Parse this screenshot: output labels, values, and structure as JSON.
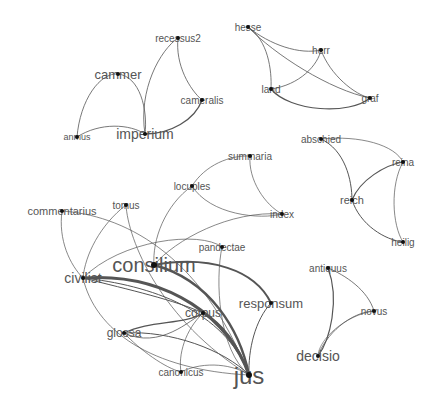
{
  "diagram": {
    "type": "network-graph",
    "node_color": "#111111",
    "edge_color": "#555555",
    "label_color": "#555555",
    "nodes": [
      {
        "id": "cammer",
        "label": "cammer",
        "x": 118,
        "y": 74,
        "size": 13
      },
      {
        "id": "recessus2",
        "label": "recessus2",
        "x": 178,
        "y": 38,
        "size": 10
      },
      {
        "id": "cameralis",
        "label": "cameralis",
        "x": 202,
        "y": 100,
        "size": 10
      },
      {
        "id": "anmus",
        "label": "anmus",
        "x": 77,
        "y": 137,
        "size": 9
      },
      {
        "id": "imperium",
        "label": "imperium",
        "x": 145,
        "y": 134,
        "size": 14
      },
      {
        "id": "hesse",
        "label": "hesse",
        "x": 248,
        "y": 27,
        "size": 10
      },
      {
        "id": "herr",
        "label": "herr",
        "x": 321,
        "y": 50,
        "size": 10
      },
      {
        "id": "land",
        "label": "land",
        "x": 271,
        "y": 89,
        "size": 10
      },
      {
        "id": "graf",
        "label": "graf",
        "x": 370,
        "y": 98,
        "size": 10
      },
      {
        "id": "abschied",
        "label": "abschied",
        "x": 321,
        "y": 139,
        "size": 10
      },
      {
        "id": "reina",
        "label": "reina",
        "x": 403,
        "y": 162,
        "size": 10
      },
      {
        "id": "reich",
        "label": "reich",
        "x": 352,
        "y": 200,
        "size": 11
      },
      {
        "id": "heilig",
        "label": "heilig",
        "x": 403,
        "y": 242,
        "size": 10
      },
      {
        "id": "summaria",
        "label": "summaria",
        "x": 250,
        "y": 156,
        "size": 10
      },
      {
        "id": "locuples",
        "label": "locuples",
        "x": 192,
        "y": 186,
        "size": 10
      },
      {
        "id": "tomus",
        "label": "tomus",
        "x": 126,
        "y": 205,
        "size": 10
      },
      {
        "id": "commentarius",
        "label": "commentarius",
        "x": 62,
        "y": 211,
        "size": 11
      },
      {
        "id": "index",
        "label": "index",
        "x": 282,
        "y": 214,
        "size": 10
      },
      {
        "id": "pandectae",
        "label": "pandectae",
        "x": 222,
        "y": 247,
        "size": 10
      },
      {
        "id": "consilium",
        "label": "consilium",
        "x": 154,
        "y": 265,
        "size": 20
      },
      {
        "id": "civilist",
        "label": "civilist",
        "x": 83,
        "y": 278,
        "size": 14
      },
      {
        "id": "responsum",
        "label": "responsum",
        "x": 271,
        "y": 303,
        "size": 13
      },
      {
        "id": "corpus",
        "label": "corpus",
        "x": 203,
        "y": 313,
        "size": 12
      },
      {
        "id": "glossa",
        "label": "glossa",
        "x": 124,
        "y": 333,
        "size": 12
      },
      {
        "id": "canonicus",
        "label": "canonicus",
        "x": 181,
        "y": 372,
        "size": 10
      },
      {
        "id": "jus",
        "label": "jus",
        "x": 249,
        "y": 375,
        "size": 24
      },
      {
        "id": "antiquus",
        "label": "antiquus",
        "x": 328,
        "y": 268,
        "size": 10
      },
      {
        "id": "novus",
        "label": "novus",
        "x": 374,
        "y": 311,
        "size": 10
      },
      {
        "id": "decisio",
        "label": "decisio",
        "x": 318,
        "y": 356,
        "size": 14
      }
    ],
    "edges": [
      {
        "d": "M77,137 C80,100 100,72 118,74",
        "w": 0.8
      },
      {
        "d": "M118,74 C140,76 148,110 145,134",
        "w": 0.8
      },
      {
        "d": "M77,137 C100,122 130,124 145,134",
        "w": 0.8
      },
      {
        "d": "M145,134 C138,90 160,50 178,38",
        "w": 0.8
      },
      {
        "d": "M178,38 C175,65 190,90 202,100",
        "w": 0.8
      },
      {
        "d": "M145,134 C170,134 195,120 202,100",
        "w": 1.3
      },
      {
        "d": "M248,27 C270,45 300,55 321,50",
        "w": 0.8
      },
      {
        "d": "M248,27 C275,55 330,90 370,98",
        "w": 0.8
      },
      {
        "d": "M248,27 C268,40 272,70 271,89",
        "w": 0.8
      },
      {
        "d": "M271,89 C300,85 318,65 321,50",
        "w": 0.8
      },
      {
        "d": "M321,50 C330,75 355,95 370,98",
        "w": 0.8
      },
      {
        "d": "M271,89 C290,112 350,115 370,98",
        "w": 1.2
      },
      {
        "d": "M321,139 C345,150 352,180 352,200",
        "w": 1.0
      },
      {
        "d": "M321,139 C360,135 395,145 403,162",
        "w": 0.7
      },
      {
        "d": "M352,200 C360,180 385,165 403,162",
        "w": 1.2
      },
      {
        "d": "M352,200 C360,225 385,240 403,242",
        "w": 1.0
      },
      {
        "d": "M403,162 C390,185 392,225 403,242",
        "w": 0.7
      },
      {
        "d": "M192,186 C205,165 230,155 250,156",
        "w": 0.7
      },
      {
        "d": "M250,156 C248,180 265,205 282,214",
        "w": 0.7
      },
      {
        "d": "M192,186 C210,215 260,220 282,214",
        "w": 0.7
      },
      {
        "d": "M192,186 C165,205 152,240 154,265",
        "w": 0.7
      },
      {
        "d": "M282,214 C230,210 175,240 154,265",
        "w": 0.7
      },
      {
        "d": "M62,211 C120,215 200,250 249,375",
        "w": 0.7
      },
      {
        "d": "M62,211 C58,240 70,265 83,278",
        "w": 0.7
      },
      {
        "d": "M126,205 C100,225 85,255 83,278",
        "w": 0.7
      },
      {
        "d": "M126,205 C128,240 160,320 249,375",
        "w": 0.7
      },
      {
        "d": "M83,278 C120,240 200,230 222,247",
        "w": 0.7
      },
      {
        "d": "M222,247 C215,280 218,350 249,375",
        "w": 0.7
      },
      {
        "d": "M154,265 C210,255 255,270 271,303",
        "w": 2.0
      },
      {
        "d": "M271,303 C255,320 248,350 249,375",
        "w": 1.0
      },
      {
        "d": "M83,278 C170,272 230,320 249,375",
        "w": 3.0
      },
      {
        "d": "M154,265 C210,280 240,330 249,375",
        "w": 2.4
      },
      {
        "d": "M83,278 C150,285 225,310 249,375",
        "w": 1.0
      },
      {
        "d": "M203,313 C225,325 240,350 249,375",
        "w": 2.0
      },
      {
        "d": "M83,278 C130,290 175,300 203,313",
        "w": 1.0
      },
      {
        "d": "M124,333 C150,320 185,325 203,313",
        "w": 1.2
      },
      {
        "d": "M124,333 C160,350 190,320 203,313",
        "w": 0.8
      },
      {
        "d": "M124,333 C170,330 225,350 249,375",
        "w": 1.0
      },
      {
        "d": "M83,278 C95,330 150,370 249,375",
        "w": 0.7
      },
      {
        "d": "M203,313 C185,330 178,355 181,372",
        "w": 0.7
      },
      {
        "d": "M181,372 C205,360 235,365 249,375",
        "w": 0.7
      },
      {
        "d": "M124,333 C140,350 165,368 181,372",
        "w": 0.7
      },
      {
        "d": "M328,268 C345,275 368,290 374,311",
        "w": 0.8
      },
      {
        "d": "M328,268 C340,300 330,340 318,356",
        "w": 1.2
      },
      {
        "d": "M374,311 C350,312 325,335 318,356",
        "w": 0.8
      },
      {
        "d": "M374,311 C345,315 318,340 318,356",
        "w": 0.6
      }
    ]
  }
}
